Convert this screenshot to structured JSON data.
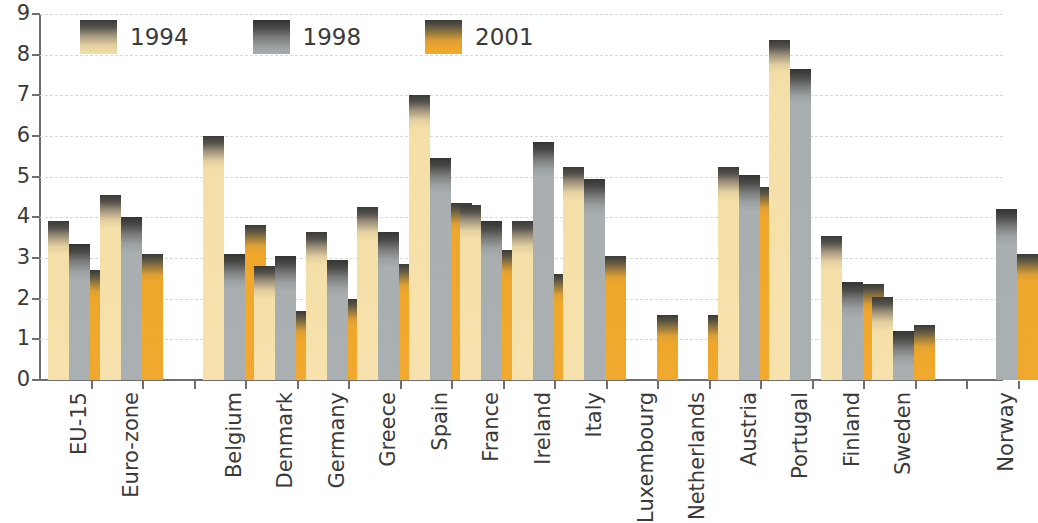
{
  "chart_data": {
    "type": "bar",
    "title": "",
    "subtitle": "",
    "xlabel": "",
    "ylabel": "",
    "ylim": [
      0,
      9
    ],
    "yticks": [
      0,
      1,
      2,
      3,
      4,
      5,
      6,
      7,
      8,
      9
    ],
    "ytick_labels": [
      "0",
      "1",
      "2",
      "3",
      "4",
      "5",
      "6",
      "7",
      "8",
      "9"
    ],
    "grid": true,
    "grid_style": "horizontal dashed",
    "legend_position": "top-left inside plot",
    "categories": [
      "EU-15",
      "Euro-zone",
      "",
      "Belgium",
      "Denmark",
      "Germany",
      "Greece",
      "Spain",
      "France",
      "Ireland",
      "Italy",
      "Luxembourg",
      "Netherlands",
      "Austria",
      "Portugal",
      "Finland",
      "Sweden",
      "",
      "Norway"
    ],
    "series": [
      {
        "name": "1994",
        "color": "#f7e2ad",
        "values": [
          3.9,
          4.55,
          null,
          6.0,
          2.8,
          3.65,
          4.25,
          7.0,
          4.3,
          3.9,
          5.25,
          null,
          null,
          5.25,
          8.35,
          3.55,
          2.05,
          null,
          null
        ]
      },
      {
        "name": "1998",
        "color": "#aab0b2",
        "values": [
          3.35,
          4.0,
          null,
          3.1,
          3.05,
          2.95,
          3.65,
          5.45,
          3.9,
          5.85,
          4.95,
          null,
          null,
          5.05,
          7.65,
          2.4,
          1.2,
          null,
          4.2
        ]
      },
      {
        "name": "2001",
        "color": "#f0a92e",
        "values": [
          2.7,
          3.1,
          null,
          3.8,
          1.7,
          2.0,
          2.85,
          4.35,
          3.2,
          2.6,
          3.05,
          1.6,
          1.6,
          4.75,
          null,
          2.35,
          1.35,
          null,
          3.1
        ]
      }
    ]
  }
}
